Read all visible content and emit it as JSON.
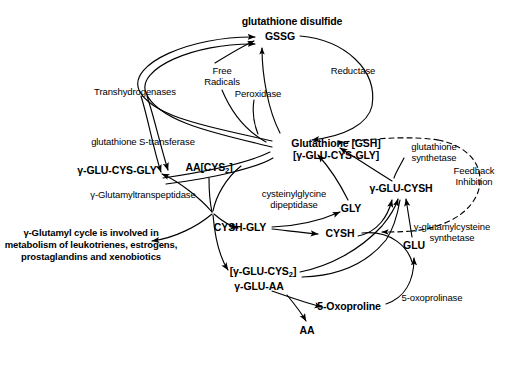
{
  "diagram": {
    "ink_color": "#000000",
    "background_color": "#ffffff"
  },
  "metabolites": {
    "gssg_title": "glutathione disulfide",
    "gssg": "GSSG",
    "gsh_line1": "Glutathione [GSH]",
    "gsh_line2": "[γ-GLU-CYS-GLY]",
    "glu_cys_gly": "γ-GLU-CYS-GLY",
    "aa_cys2_pre": "AA[CYS",
    "aa_cys2_sub": "2",
    "aa_cys2_post": "]",
    "gly": "GLY",
    "cysh_gly": "CYSH-GLY",
    "cysh": "CYSH",
    "glu_cysh": "γ-GLU-CYSH",
    "glu": "GLU",
    "glu_cys2_pre": "[γ-GLU-CYS",
    "glu_cys2_sub": "2",
    "glu_cys2_post": "]",
    "glu_aa": "γ-GLU-AA",
    "oxoproline": "5-Oxoproline",
    "aa": "AA"
  },
  "enzymes": {
    "transhydrogenases": "Transhydrogenases",
    "free_radicals_line1": "Free",
    "free_radicals_line2": "Radicals",
    "peroxidase": "Peroxidase",
    "reductase": "Reductase",
    "glutathione_s_transferase": "glutathione S-transferase",
    "glutamyltranspeptidase": "γ-Glutamyltranspeptidase",
    "cysteinylglycine_line1": "cysteinylglycine",
    "cysteinylglycine_line2": "dipeptidase",
    "glutathione_synthetase_line1": "glutathione",
    "glutathione_synthetase_line2": "synthetase",
    "glutamylcysteine_synthetase_line1": "γ-glutamylcysteine",
    "glutamylcysteine_synthetase_line2": "synthetase",
    "oxoprolinase": "5-oxoprolinase",
    "feedback_line1": "Feedback",
    "feedback_line2": "Inhibition"
  },
  "annotations": {
    "gamma_glutamyl_cycle_note": "γ-Glutamyl cycle is involved in metabolism of leukotrienes, estrogens, prostaglandins and xenobiotics"
  }
}
